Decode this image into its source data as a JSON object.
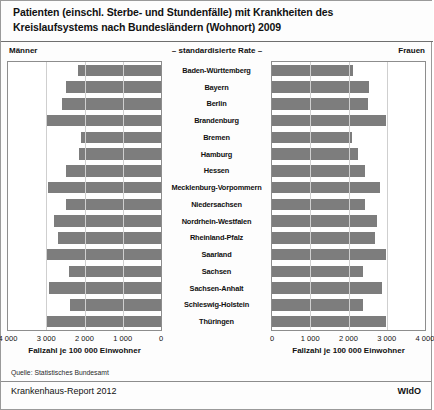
{
  "title": {
    "line1": "Patienten (einschl. Sterbe- und Stundenfälle) mit Krankheiten des",
    "line2": "Kreislaufsystems nach Bundesländern (Wohnort) 2009"
  },
  "chart": {
    "subtitle": "– standardisierte Rate –",
    "left_panel_label": "Männer",
    "right_panel_label": "Frauen",
    "axis_title_left": "Fallzahl je 100 000 Einwohner",
    "axis_title_right": "Fallzahl je 100 000 Einwohner",
    "ticks_left": [
      "4 000",
      "3 000",
      "2 000",
      "1 000",
      "0"
    ],
    "ticks_right": [
      "0",
      "1 000",
      "2 000",
      "3 000",
      "4 000"
    ],
    "bar_color": "#7d7d7d",
    "grid_color": "#cfcfcf"
  },
  "footer": {
    "source": "Quelle: Statistisches Bundesamt",
    "report": "Krankenhaus-Report 2012",
    "publisher": "WIdO"
  },
  "chart_data": {
    "type": "bar",
    "orientation": "horizontal",
    "layout": "back-to-back population pyramid",
    "title": "Patienten (einschl. Sterbe- und Stundenfälle) mit Krankheiten des Kreislaufsystems nach Bundesländern (Wohnort) 2009",
    "subtitle": "– standardisierte Rate –",
    "xlabel": "Fallzahl je 100 000 Einwohner",
    "ylabel": "",
    "xlim": [
      0,
      4000
    ],
    "xticks": [
      0,
      1000,
      2000,
      3000,
      4000
    ],
    "grid": true,
    "legend": "none",
    "categories": [
      "Baden-Württemberg",
      "Bayern",
      "Berlin",
      "Brandenburg",
      "Bremen",
      "Hamburg",
      "Hessen",
      "Mecklenburg-Vorpommern",
      "Niedersachsen",
      "Nordrhein-Westfalen",
      "Rheinland-Pfalz",
      "Saarland",
      "Sachsen",
      "Sachsen-Anhalt",
      "Schleswig-Holstein",
      "Thüringen"
    ],
    "series": [
      {
        "name": "Männer",
        "side": "left",
        "values": [
          2180,
          2490,
          2600,
          2990,
          2080,
          2150,
          2490,
          2960,
          2490,
          2800,
          2700,
          3000,
          2410,
          2930,
          2380,
          2980
        ]
      },
      {
        "name": "Frauen",
        "side": "right",
        "values": [
          2130,
          2530,
          2500,
          2980,
          2080,
          2250,
          2440,
          2830,
          2440,
          2740,
          2700,
          2990,
          2370,
          2870,
          2390,
          2980
        ]
      }
    ]
  }
}
